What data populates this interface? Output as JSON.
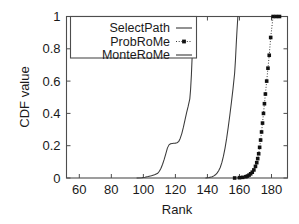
{
  "chart_data": {
    "type": "line",
    "title": "",
    "xlabel": "Rank",
    "ylabel": "CDF value",
    "xlim": [
      52,
      190
    ],
    "ylim": [
      0,
      1
    ],
    "grid": false,
    "legend_position": "top-left",
    "xticks": [
      60,
      80,
      100,
      120,
      140,
      160,
      180
    ],
    "xtick_labels": [
      "60",
      "80",
      "100",
      "120",
      "140",
      "160",
      "180"
    ],
    "yticks": [
      0,
      0.2,
      0.4,
      0.6,
      0.8,
      1
    ],
    "ytick_labels": [
      "0",
      "0.2",
      "0.4",
      "0.6",
      "0.8",
      "1"
    ],
    "series": [
      {
        "name": "SelectPath",
        "style": "solid",
        "marker": "none",
        "color": "#3a3a3a",
        "x": [
          96,
          99,
          101,
          103,
          105,
          107,
          109,
          110,
          111,
          112,
          113,
          114,
          115,
          116,
          117,
          118,
          119,
          120,
          121,
          122,
          123,
          124,
          125,
          126,
          127,
          128,
          129,
          129.5,
          130,
          130.5,
          131,
          131.5
        ],
        "y": [
          0.0,
          0.002,
          0.005,
          0.009,
          0.014,
          0.02,
          0.03,
          0.042,
          0.06,
          0.085,
          0.115,
          0.15,
          0.185,
          0.205,
          0.212,
          0.214,
          0.215,
          0.216,
          0.218,
          0.225,
          0.245,
          0.275,
          0.315,
          0.36,
          0.405,
          0.445,
          0.49,
          0.55,
          0.64,
          0.76,
          0.9,
          1.0
        ]
      },
      {
        "name": "MonteRoMe",
        "style": "solid",
        "marker": "none",
        "color": "#3a3a3a",
        "x": [
          139,
          141,
          143,
          144,
          145,
          146,
          147,
          148,
          149,
          150,
          151,
          152,
          153,
          154,
          155,
          156,
          157,
          157.5,
          158,
          158.5,
          159
        ],
        "y": [
          0.0,
          0.003,
          0.008,
          0.013,
          0.02,
          0.03,
          0.045,
          0.065,
          0.095,
          0.135,
          0.185,
          0.245,
          0.315,
          0.39,
          0.47,
          0.555,
          0.65,
          0.73,
          0.83,
          0.92,
          1.0
        ]
      },
      {
        "name": "ProbRoMe",
        "style": "dotted",
        "marker": "square",
        "color": "#3a3a3a",
        "x": [
          157,
          160,
          162,
          164,
          165,
          166,
          167,
          168,
          169,
          170,
          170.8,
          171.4,
          172,
          172.6,
          173.2,
          173.8,
          174.4,
          175,
          175.6,
          176.2,
          177,
          177.8,
          178.6,
          179.5,
          181,
          183,
          185
        ],
        "y": [
          0.0,
          0.002,
          0.004,
          0.008,
          0.012,
          0.018,
          0.026,
          0.036,
          0.05,
          0.072,
          0.095,
          0.12,
          0.15,
          0.19,
          0.235,
          0.285,
          0.34,
          0.4,
          0.46,
          0.52,
          0.6,
          0.68,
          0.76,
          0.87,
          1.0,
          1.0,
          1.0
        ]
      }
    ],
    "legend_entries": [
      {
        "label": "SelectPath",
        "style": "solid",
        "marker": "none"
      },
      {
        "label": "ProbRoMe",
        "style": "dotted",
        "marker": "square"
      },
      {
        "label": "MonteRoMe",
        "style": "solid",
        "marker": "none"
      }
    ]
  }
}
